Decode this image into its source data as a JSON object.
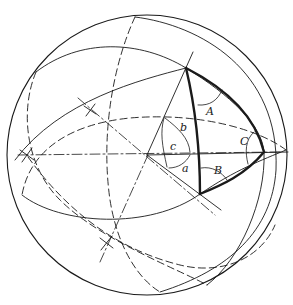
{
  "diagram": {
    "labels": {
      "angle_A": "A",
      "angle_B": "B",
      "angle_C": "C",
      "side_a": "a",
      "side_b": "b",
      "side_c": "c"
    },
    "colors": {
      "stroke": "#1a1a1a",
      "background": "#ffffff"
    }
  }
}
